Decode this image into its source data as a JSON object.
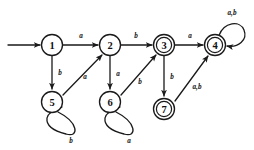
{
  "diagram": {
    "kind": "finite-state-automaton",
    "title": "",
    "alphabet": [
      "a",
      "b"
    ],
    "start_state": "1",
    "accepting_states": [
      "3",
      "4",
      "7"
    ],
    "start_arrow_label": "",
    "states": [
      {
        "id": "1",
        "label": "1",
        "cx": 52,
        "cy": 45,
        "r": 10.5,
        "accepting": false,
        "start": true
      },
      {
        "id": "2",
        "label": "2",
        "cx": 110,
        "cy": 45,
        "r": 10.5,
        "accepting": false,
        "start": false
      },
      {
        "id": "3",
        "label": "3",
        "cx": 164,
        "cy": 45,
        "r": 10.5,
        "accepting": true,
        "start": false
      },
      {
        "id": "4",
        "label": "4",
        "cx": 215,
        "cy": 45,
        "r": 10.5,
        "accepting": true,
        "start": false
      },
      {
        "id": "5",
        "label": "5",
        "cx": 52,
        "cy": 102,
        "r": 10.5,
        "accepting": false,
        "start": false
      },
      {
        "id": "6",
        "label": "6",
        "cx": 110,
        "cy": 102,
        "r": 10.5,
        "accepting": false,
        "start": false
      },
      {
        "id": "7",
        "label": "7",
        "cx": 164,
        "cy": 109,
        "r": 10.5,
        "accepting": true,
        "start": false
      }
    ],
    "transitions": [
      {
        "from": "1",
        "to": "2",
        "label": "a",
        "label_x": 81,
        "label_y": 36
      },
      {
        "from": "2",
        "to": "3",
        "label": "b",
        "label_x": 136,
        "label_y": 36
      },
      {
        "from": "3",
        "to": "4",
        "label": "a",
        "label_x": 190,
        "label_y": 36
      },
      {
        "from": "1",
        "to": "5",
        "label": "b",
        "label_x": 60,
        "label_y": 73
      },
      {
        "from": "2",
        "to": "6",
        "label": "a",
        "label_x": 118,
        "label_y": 74
      },
      {
        "from": "3",
        "to": "7",
        "label": "b",
        "label_x": 172,
        "label_y": 77
      },
      {
        "from": "5",
        "to": "2",
        "label": "a",
        "label_x": 85,
        "label_y": 77
      },
      {
        "from": "6",
        "to": "3",
        "label": "b",
        "label_x": 140,
        "label_y": 82
      },
      {
        "from": "7",
        "to": "4",
        "label": "a,b",
        "label_x": 196,
        "label_y": 86
      },
      {
        "from": "5",
        "to": "5",
        "label": "b",
        "label_x": 71,
        "label_y": 140,
        "self_loop": true
      },
      {
        "from": "6",
        "to": "6",
        "label": "a",
        "label_x": 129,
        "label_y": 140,
        "self_loop": true
      },
      {
        "from": "4",
        "to": "4",
        "label": "a,b",
        "label_x": 232,
        "label_y": 13,
        "self_loop": true
      }
    ]
  }
}
